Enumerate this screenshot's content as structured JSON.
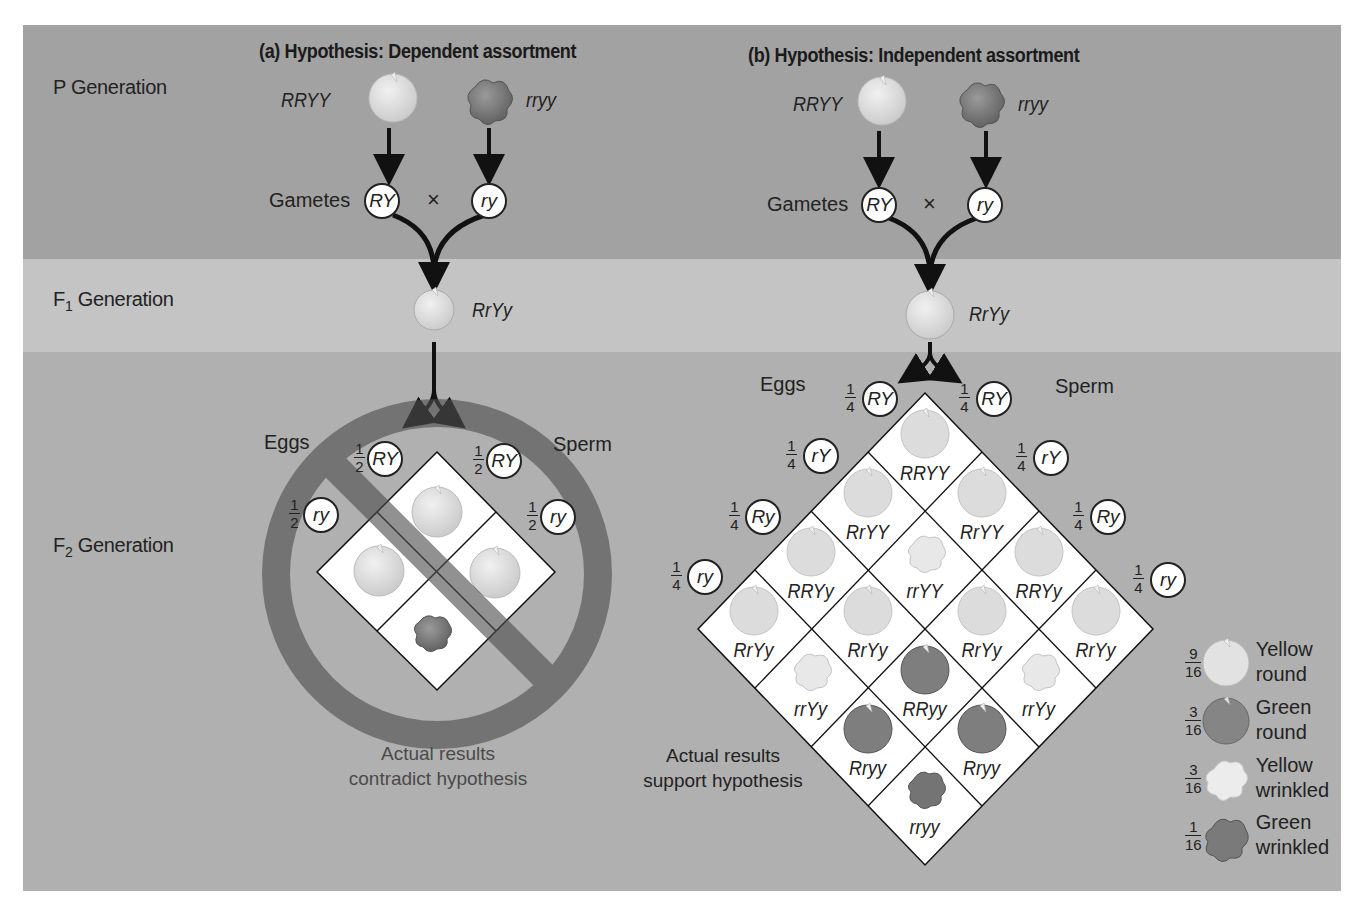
{
  "panel_a": {
    "title": "(a) Hypothesis: Dependent assortment",
    "parent_left": "RRYY",
    "parent_right": "rryy",
    "gametes_label": "Gametes",
    "cross_symbol": "×",
    "gamete_left": "RY",
    "gamete_right": "ry",
    "f1_genotype": "RrYy",
    "eggs_label": "Eggs",
    "sperm_label": "Sperm",
    "egg_gametes": [
      {
        "num": "1",
        "den": "2",
        "allele": "RY"
      },
      {
        "num": "1",
        "den": "2",
        "allele": "ry"
      }
    ],
    "sperm_gametes": [
      {
        "num": "1",
        "den": "2",
        "allele": "RY"
      },
      {
        "num": "1",
        "den": "2",
        "allele": "ry"
      }
    ],
    "caption_line1": "Actual results",
    "caption_line2": "contradict hypothesis"
  },
  "panel_b": {
    "title": "(b) Hypothesis: Independent assortment",
    "parent_left": "RRYY",
    "parent_right": "rryy",
    "gametes_label": "Gametes",
    "cross_symbol": "×",
    "gamete_left": "RY",
    "gamete_right": "ry",
    "f1_genotype": "RrYy",
    "eggs_label": "Eggs",
    "sperm_label": "Sperm",
    "egg_gametes": [
      {
        "num": "1",
        "den": "4",
        "allele": "RY"
      },
      {
        "num": "1",
        "den": "4",
        "allele": "rY"
      },
      {
        "num": "1",
        "den": "4",
        "allele": "Ry"
      },
      {
        "num": "1",
        "den": "4",
        "allele": "ry"
      }
    ],
    "sperm_gametes": [
      {
        "num": "1",
        "den": "4",
        "allele": "RY"
      },
      {
        "num": "1",
        "den": "4",
        "allele": "rY"
      },
      {
        "num": "1",
        "den": "4",
        "allele": "Ry"
      },
      {
        "num": "1",
        "den": "4",
        "allele": "ry"
      }
    ],
    "punnett_cells": [
      [
        "RRYY",
        "RrYY",
        "RRYy",
        "RrYy"
      ],
      [
        "RrYY",
        "rrYY",
        "RrYy",
        "rrYy"
      ],
      [
        "RRYy",
        "RrYy",
        "RRyy",
        "Rryy"
      ],
      [
        "RrYy",
        "rrYy",
        "Rryy",
        "rryy"
      ]
    ],
    "caption_line1": "Actual results",
    "caption_line2": "support hypothesis",
    "legend": [
      {
        "num": "9",
        "den": "16",
        "line1": "Yellow",
        "line2": "round",
        "pea": "yellow-round"
      },
      {
        "num": "3",
        "den": "16",
        "line1": "Green",
        "line2": "round",
        "pea": "green-round"
      },
      {
        "num": "3",
        "den": "16",
        "line1": "Yellow",
        "line2": "wrinkled",
        "pea": "yellow-wrinkled"
      },
      {
        "num": "1",
        "den": "16",
        "line1": "Green",
        "line2": "wrinkled",
        "pea": "green-wrinkled"
      }
    ]
  },
  "generations": {
    "p": "P Generation",
    "f1_prefix": "F",
    "f1_sub": "1",
    "f2_prefix": "F",
    "f2_sub": "2",
    "suffix": " Generation"
  },
  "colors": {
    "band_p": "#a2a2a2",
    "band_f1": "#c4c4c4",
    "band_f2": "#b0b0b0",
    "prohibition_ring": "#7a7a7a",
    "yellow_pea": "#d8d8d8",
    "green_pea": "#8a8a8a"
  }
}
